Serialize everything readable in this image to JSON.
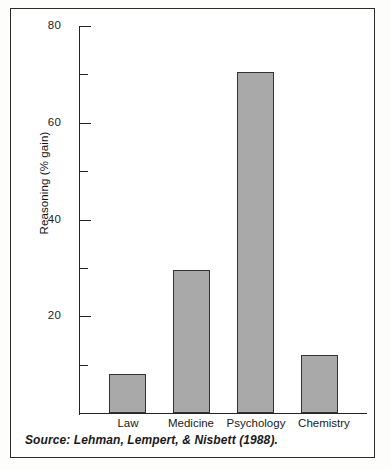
{
  "chart_data": {
    "type": "bar",
    "title": "",
    "subtitle": "",
    "xlabel": "",
    "ylabel": "Reasoning (% gain)",
    "categories": [
      "Law",
      "Medicine",
      "Psychology",
      "Chemistry"
    ],
    "values": [
      8,
      29.5,
      70.5,
      12
    ],
    "series": [
      {
        "name": "Reasoning (% gain)",
        "values": [
          8,
          29.5,
          70.5,
          12
        ]
      }
    ],
    "ylim": [
      0,
      80
    ],
    "xlim": [
      0,
      4
    ],
    "y_major_ticks": [
      20,
      40,
      60,
      80
    ],
    "y_minor_ticks": [
      10,
      30,
      50,
      70
    ],
    "y_tick_labels": [
      "20",
      "40",
      "60",
      "80"
    ],
    "grid": false,
    "legend": false,
    "legend_position": "none",
    "bar_fill_color": "#a9a9a9",
    "bar_edge_color": "#333333",
    "axis_color": "#232323",
    "background_color": "#ffffff",
    "annotations": [
      {
        "name": "source-note",
        "text": "Source: Lehman, Lempert, & Nisbett (1988).",
        "style": "italic"
      }
    ]
  },
  "figure": {
    "source_note": "Source: Lehman, Lempert, & Nisbett (1988).",
    "y_axis_title": "Reasoning (% gain)"
  },
  "axis": {
    "tick_labels": {
      "t80": "80",
      "t60": "60",
      "t40": "40",
      "t20": "20"
    }
  },
  "categories": {
    "c0": "Law",
    "c1": "Medicine",
    "c2": "Psychology",
    "c3": "Chemistry"
  }
}
